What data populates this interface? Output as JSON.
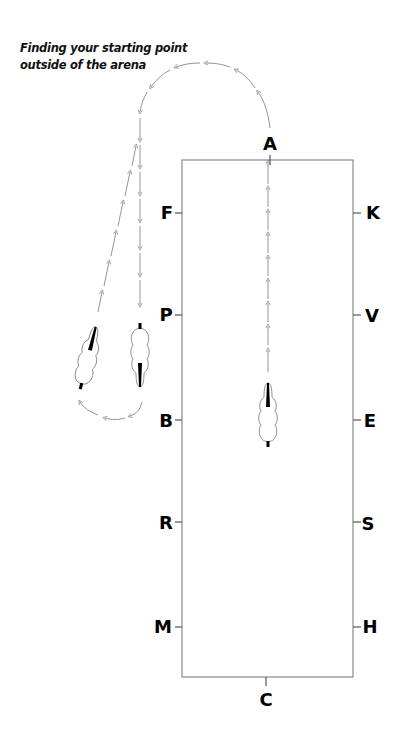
{
  "title": {
    "line1": "Finding your starting point",
    "line2": "outside of the arena"
  },
  "arena": {
    "letters": {
      "top": "A",
      "bottom": "C",
      "left": [
        "F",
        "P",
        "B",
        "R",
        "M"
      ],
      "right": [
        "K",
        "V",
        "E",
        "S",
        "H"
      ]
    }
  },
  "colors": {
    "line": "#8a8a8a",
    "text": "#000000",
    "background": "#ffffff"
  }
}
